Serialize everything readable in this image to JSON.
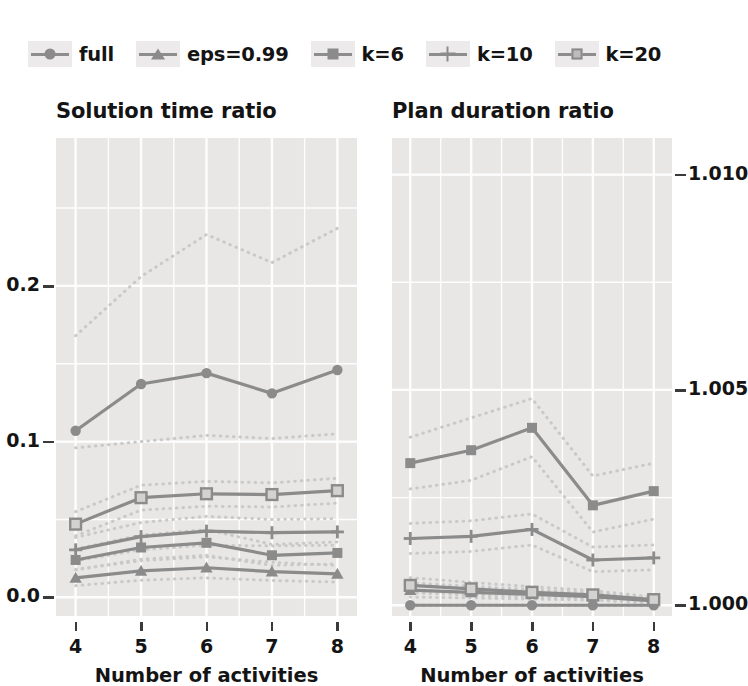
{
  "legend": {
    "position": "top-left",
    "items": [
      {
        "label": "full",
        "marker": "circle-marker-icon"
      },
      {
        "label": "eps=0.99",
        "marker": "triangle-marker-icon"
      },
      {
        "label": "k=6",
        "marker": "square-marker-icon"
      },
      {
        "label": "k=10",
        "marker": "plus-marker-icon"
      },
      {
        "label": "k=20",
        "marker": "open-square-marker-icon"
      }
    ]
  },
  "colors": {
    "panel_background": "#e8e7e6",
    "gridline": "#fdfdfd",
    "series_line": "#8b8b8b",
    "band_dotted": "#c9c9c9",
    "text": "#141414"
  },
  "chart_data": [
    {
      "type": "line",
      "panel": "left",
      "title": "Solution time ratio",
      "xlabel": "Number of activities",
      "ylabel": "",
      "x": [
        4,
        5,
        6,
        7,
        8
      ],
      "xticklabels": [
        "4",
        "5",
        "6",
        "7",
        "8"
      ],
      "xlim": [
        3.7,
        8.3
      ],
      "ylim": [
        -0.012,
        0.295
      ],
      "yticks": [
        0.0,
        0.1,
        0.2
      ],
      "yticklabels": [
        "0.0",
        "0.1",
        "0.2"
      ],
      "yaxis_side": "left",
      "grid": true,
      "legend_position": "above-figure",
      "series": [
        {
          "name": "full",
          "marker": "circle",
          "values": [
            0.107,
            0.137,
            0.144,
            0.131,
            0.146
          ],
          "band_upper": [
            0.168,
            0.206,
            0.233,
            0.215,
            0.237
          ],
          "band_lower": [
            0.096,
            0.1,
            0.104,
            0.102,
            0.105
          ]
        },
        {
          "name": "eps=0.99",
          "marker": "triangle",
          "values": [
            0.0125,
            0.017,
            0.019,
            0.0165,
            0.015
          ],
          "band_upper": [
            0.018,
            0.0235,
            0.026,
            0.0225,
            0.0205
          ],
          "band_lower": [
            0.0075,
            0.011,
            0.0125,
            0.0108,
            0.0098
          ]
        },
        {
          "name": "k=6",
          "marker": "square",
          "values": [
            0.024,
            0.032,
            0.035,
            0.027,
            0.0285
          ],
          "band_upper": [
            0.031,
            0.04,
            0.0435,
            0.034,
            0.0355
          ],
          "band_lower": [
            0.0175,
            0.0245,
            0.027,
            0.0205,
            0.0215
          ]
        },
        {
          "name": "k=10",
          "marker": "plus",
          "values": [
            0.0305,
            0.039,
            0.0425,
            0.0415,
            0.042
          ],
          "band_upper": [
            0.0385,
            0.048,
            0.052,
            0.05,
            0.0505
          ],
          "band_lower": [
            0.0235,
            0.0305,
            0.0335,
            0.033,
            0.0335
          ]
        },
        {
          "name": "k=20",
          "marker": "open-square",
          "values": [
            0.047,
            0.064,
            0.0665,
            0.066,
            0.0685
          ],
          "band_upper": [
            0.055,
            0.072,
            0.0745,
            0.0735,
            0.0765
          ],
          "band_lower": [
            0.0395,
            0.056,
            0.0585,
            0.058,
            0.0605
          ]
        }
      ]
    },
    {
      "type": "line",
      "panel": "right",
      "title": "Plan duration ratio",
      "xlabel": "Number of activities",
      "ylabel": "",
      "x": [
        4,
        5,
        6,
        7,
        8
      ],
      "xticklabels": [
        "4",
        "5",
        "6",
        "7",
        "8"
      ],
      "xlim": [
        3.7,
        8.3
      ],
      "ylim": [
        0.99975,
        1.01085
      ],
      "yticks": [
        1.0,
        1.005,
        1.01
      ],
      "yticklabels": [
        "1.000",
        "1.005",
        "1.010"
      ],
      "yaxis_side": "right",
      "grid": true,
      "legend_position": "above-figure",
      "series": [
        {
          "name": "full",
          "marker": "circle",
          "values": [
            1.0,
            1.0,
            1.0,
            1.0,
            1.0
          ],
          "band_upper": [
            1.0,
            1.0,
            1.0,
            1.0,
            1.0
          ],
          "band_lower": [
            1.0,
            1.0,
            1.0,
            1.0,
            1.0
          ]
        },
        {
          "name": "eps=0.99",
          "marker": "triangle",
          "values": [
            1.00035,
            1.0003,
            1.00025,
            1.0002,
            1.0001
          ],
          "band_upper": [
            1.00052,
            1.00044,
            1.00036,
            1.00029,
            1.00016
          ],
          "band_lower": [
            1.00019,
            1.00017,
            1.00014,
            1.00012,
            1.00005
          ]
        },
        {
          "name": "k=6",
          "marker": "square",
          "values": [
            1.0033,
            1.0036,
            1.00412,
            1.00232,
            1.00265
          ],
          "band_upper": [
            1.0039,
            1.00435,
            1.0048,
            1.003,
            1.0033
          ],
          "band_lower": [
            1.0027,
            1.0029,
            1.00345,
            1.0017,
            1.002
          ]
        },
        {
          "name": "k=10",
          "marker": "plus",
          "values": [
            1.00155,
            1.0016,
            1.00176,
            1.00105,
            1.0011
          ],
          "band_upper": [
            1.0019,
            1.00196,
            1.00212,
            1.00135,
            1.0014
          ],
          "band_lower": [
            1.0012,
            1.00125,
            1.0014,
            1.00078,
            1.00082
          ]
        },
        {
          "name": "k=20",
          "marker": "open-square",
          "values": [
            1.00046,
            1.00038,
            1.0003,
            1.00024,
            1.00013
          ],
          "band_upper": [
            1.00064,
            1.00053,
            1.00043,
            1.00034,
            1.00019
          ],
          "band_lower": [
            1.00029,
            1.00024,
            1.00018,
            1.00015,
            1.00007
          ]
        }
      ]
    }
  ]
}
